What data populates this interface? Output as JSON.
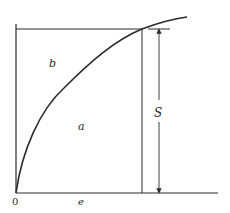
{
  "diagram": {
    "type": "stress-strain curve",
    "colors": {
      "ink": "#2a2a2a",
      "background": "#ffffff"
    },
    "labels": {
      "origin": "0",
      "x_axis": "e",
      "dimension": "S",
      "region_above_curve": "b",
      "region_below_curve": "a"
    },
    "geometry": {
      "origin": [
        16,
        193
      ],
      "axis_x_end": 218,
      "axis_y_top": 24,
      "top_line_y": 29,
      "top_line_x_end": 170,
      "vertical_line_x": 142,
      "dimension_arrow_x": 159,
      "curve_end": [
        187,
        17
      ]
    }
  }
}
